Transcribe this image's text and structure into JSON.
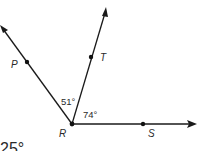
{
  "diagram": {
    "vertex": {
      "name": "R",
      "x": 72,
      "y": 124
    },
    "rays": [
      {
        "name": "RP",
        "through": "P",
        "end": {
          "x": 0,
          "y": 25
        }
      },
      {
        "name": "RT",
        "through": "T",
        "end": {
          "x": 106,
          "y": 8
        }
      },
      {
        "name": "RS",
        "through": "S",
        "end": {
          "x": 196,
          "y": 124
        }
      }
    ],
    "points": [
      {
        "label": "P",
        "x": 27,
        "y": 62
      },
      {
        "label": "T",
        "x": 91,
        "y": 57
      },
      {
        "label": "R",
        "x": 72,
        "y": 124
      },
      {
        "label": "S",
        "x": 143,
        "y": 124
      }
    ],
    "angles": [
      {
        "between": "PRT",
        "label": "51°"
      },
      {
        "between": "TRS",
        "label": "74°"
      }
    ],
    "answer_text": "25°",
    "colors": {
      "line": "#1a1a1a",
      "text": "#2a2a2a",
      "background": "#ffffff"
    }
  }
}
